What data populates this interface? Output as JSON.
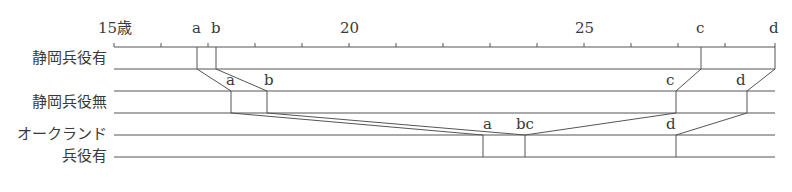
{
  "axis": {
    "start_label": "15歳",
    "labels": [
      {
        "text": "15歳",
        "age": 15
      },
      {
        "text": "20",
        "age": 20
      },
      {
        "text": "25",
        "age": 25
      }
    ],
    "min_age": 15,
    "tick_interval": 1
  },
  "rows": [
    {
      "label": "静岡兵役有",
      "markers": {
        "a": "a",
        "b": "b",
        "c": "c",
        "d": "d"
      }
    },
    {
      "label": "静岡兵役無",
      "markers": {
        "a": "a",
        "b": "b",
        "c": "c",
        "d": "d"
      }
    },
    {
      "label_line1": "オークランド",
      "label_line2": "兵役有",
      "markers": {
        "a": "a",
        "bc": "bc",
        "d": "d"
      }
    }
  ],
  "top_markers": {
    "a": "a",
    "b": "b",
    "c": "c",
    "d": "d"
  }
}
